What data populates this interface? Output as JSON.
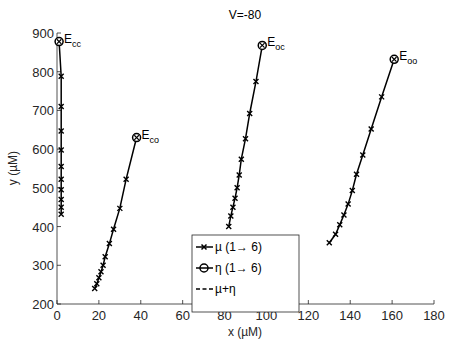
{
  "chart_data": {
    "type": "line",
    "title": "V=-80",
    "xlabel": "x (µM)",
    "ylabel": "y (µM)",
    "xlim": [
      0,
      180
    ],
    "ylim": [
      200,
      900
    ],
    "xticks": [
      0,
      20,
      40,
      60,
      80,
      100,
      120,
      140,
      160,
      180
    ],
    "yticks": [
      200,
      300,
      400,
      500,
      600,
      700,
      800,
      900
    ],
    "grid": false,
    "legend_position": "lower center (inside axes)",
    "legend": [
      {
        "label": "µ (1→ 6)",
        "style": "solid-x"
      },
      {
        "label": "η (1→ 6)",
        "style": "solid-o"
      },
      {
        "label": "µ+η",
        "style": "dashed"
      }
    ],
    "series": [
      {
        "name": "E_cc",
        "endpoint": {
          "x": 1,
          "y": 878,
          "label": "E",
          "sub": "cc"
        },
        "points": [
          [
            2,
            432
          ],
          [
            2,
            450
          ],
          [
            2,
            470
          ],
          [
            2,
            495
          ],
          [
            2,
            522
          ],
          [
            2,
            555
          ],
          [
            2,
            598
          ],
          [
            2,
            647
          ],
          [
            2,
            710
          ],
          [
            2,
            788
          ],
          [
            1,
            878
          ]
        ]
      },
      {
        "name": "E_co",
        "endpoint": {
          "x": 38,
          "y": 630,
          "label": "E",
          "sub": "co"
        },
        "points": [
          [
            18,
            240
          ],
          [
            19,
            252
          ],
          [
            20,
            268
          ],
          [
            21,
            283
          ],
          [
            22,
            300
          ],
          [
            23,
            322
          ],
          [
            25,
            356
          ],
          [
            27,
            393
          ],
          [
            30,
            447
          ],
          [
            33,
            522
          ],
          [
            38,
            630
          ]
        ]
      },
      {
        "name": "E_oc",
        "endpoint": {
          "x": 98,
          "y": 868,
          "label": "E",
          "sub": "oc"
        },
        "points": [
          [
            82,
            400
          ],
          [
            83,
            427
          ],
          [
            84,
            450
          ],
          [
            85,
            473
          ],
          [
            86,
            500
          ],
          [
            87,
            533
          ],
          [
            88,
            574
          ],
          [
            90,
            627
          ],
          [
            92,
            692
          ],
          [
            95,
            775
          ],
          [
            98,
            868
          ]
        ]
      },
      {
        "name": "E_oo",
        "endpoint": {
          "x": 161,
          "y": 832,
          "label": "E",
          "sub": "oo"
        },
        "points": [
          [
            130,
            358
          ],
          [
            133,
            380
          ],
          [
            135,
            405
          ],
          [
            137,
            430
          ],
          [
            139,
            458
          ],
          [
            141,
            493
          ],
          [
            143,
            535
          ],
          [
            146,
            585
          ],
          [
            150,
            652
          ],
          [
            155,
            735
          ],
          [
            161,
            832
          ]
        ]
      }
    ]
  },
  "colors": {
    "line": "#000000",
    "axis": "#262626",
    "background": "#ffffff",
    "legend_border": "#262626"
  }
}
